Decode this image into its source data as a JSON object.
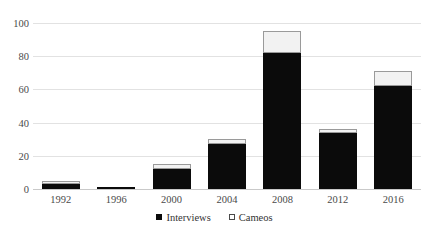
{
  "header": {
    "left_ghost": "216",
    "center_ghost": "Figure 4. Candidate appearances"
  },
  "legend": {
    "position": "bottom-center",
    "items": [
      {
        "label": "Interviews",
        "marker": "filled-square",
        "color": "#0b0b0b"
      },
      {
        "label": "Cameos",
        "marker": "hollow-square",
        "color": "#ffffff"
      }
    ]
  },
  "axis": {
    "y_ticks": [
      "0",
      "20",
      "40",
      "60",
      "80",
      "100"
    ],
    "x_ticks": [
      "1992",
      "1996",
      "2000",
      "2004",
      "2008",
      "2012",
      "2016"
    ]
  },
  "chart_data": {
    "type": "bar",
    "stacked": true,
    "title": "",
    "xlabel": "",
    "ylabel": "",
    "ylim": [
      0,
      100
    ],
    "grid": true,
    "legend_position": "bottom-center",
    "categories": [
      "1992",
      "1996",
      "2000",
      "2004",
      "2008",
      "2012",
      "2016"
    ],
    "series": [
      {
        "name": "Interviews",
        "color": "#0b0b0b",
        "values": [
          3,
          1,
          12,
          27,
          82,
          34,
          62
        ]
      },
      {
        "name": "Cameos",
        "color": "#ffffff",
        "values": [
          2,
          0,
          3,
          3,
          13,
          2,
          9
        ]
      }
    ],
    "totals": [
      5,
      1,
      15,
      30,
      95,
      36,
      71
    ]
  }
}
